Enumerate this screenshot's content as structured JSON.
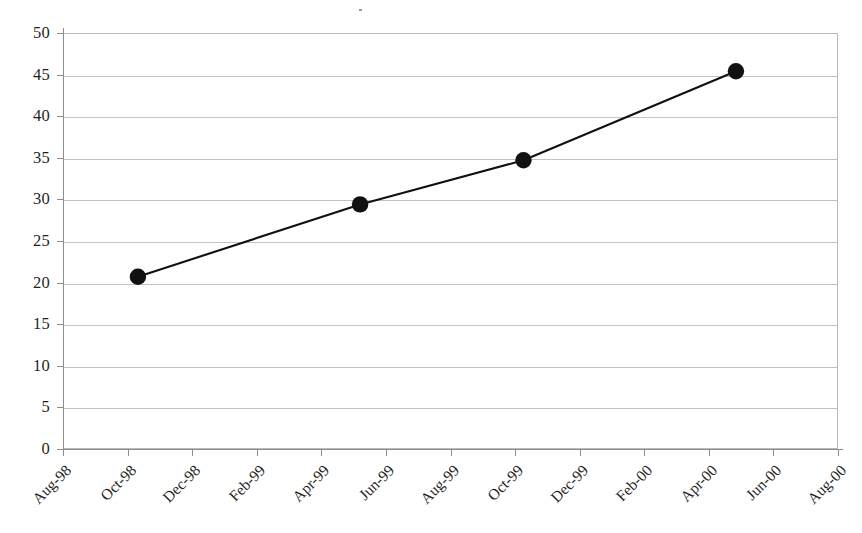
{
  "chart_data": {
    "type": "line",
    "title": "",
    "subtitle": "",
    "xlabel": "",
    "ylabel": "",
    "ylim": [
      0,
      50
    ],
    "y_ticks": [
      0,
      5,
      10,
      15,
      20,
      25,
      30,
      35,
      40,
      45,
      50
    ],
    "x_ticks": [
      "Aug-98",
      "Oct-98",
      "Dec-98",
      "Feb-99",
      "Apr-99",
      "Jun-99",
      "Aug-99",
      "Oct-99",
      "Dec-99",
      "Feb-00",
      "Apr-00",
      "Jun-00",
      "Aug-00"
    ],
    "grid": true,
    "grid_axis": "y",
    "legend": false,
    "legend_position": "none",
    "marker": "filled-circle",
    "series": [
      {
        "name": "",
        "color": "#111111",
        "points": [
          {
            "x": "Nov-98",
            "x_index": 1.16,
            "y": 20.7
          },
          {
            "x": "Jun-99",
            "x_index": 4.6,
            "y": 29.4
          },
          {
            "x": "Oct-99",
            "x_index": 7.13,
            "y": 34.7
          },
          {
            "x": "Jun-00",
            "x_index": 10.42,
            "y": 45.4
          }
        ]
      }
    ]
  },
  "axes": {
    "y": {
      "labels": [
        "50",
        "45",
        "40",
        "35",
        "30",
        "25",
        "20",
        "15",
        "10",
        "5",
        "0"
      ]
    },
    "x": {
      "labels": [
        "Aug-98",
        "Oct-98",
        "Dec-98",
        "Feb-99",
        "Apr-99",
        "Jun-99",
        "Aug-99",
        "Oct-99",
        "Dec-99",
        "Feb-00",
        "Apr-00",
        "Jun-00",
        "Aug-00"
      ]
    }
  },
  "style": {
    "background": "#ffffff",
    "gridline_color": "#c2c2c2",
    "axis_color": "#8c8c8c",
    "series_color": "#111111",
    "text_color": "#1f1f1f"
  }
}
